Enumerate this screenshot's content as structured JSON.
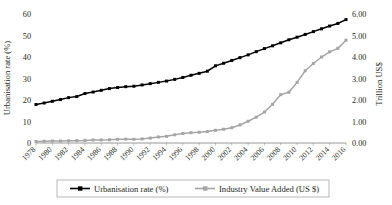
{
  "chart_data": {
    "type": "line",
    "title": "",
    "xlabel": "",
    "ylabel": "Urbanisation rate (%)",
    "y2label": "Trillion US$",
    "grid": false,
    "legend_position": "bottom",
    "x": [
      1978,
      1979,
      1980,
      1981,
      1982,
      1983,
      1984,
      1985,
      1986,
      1987,
      1988,
      1989,
      1990,
      1991,
      1992,
      1993,
      1994,
      1995,
      1996,
      1997,
      1998,
      1999,
      2000,
      2001,
      2002,
      2003,
      2004,
      2005,
      2006,
      2007,
      2008,
      2009,
      2010,
      2011,
      2012,
      2013,
      2014,
      2015,
      2016
    ],
    "xtick_labels": [
      "1978",
      "1980",
      "1982",
      "1984",
      "1986",
      "1988",
      "1990",
      "1992",
      "1994",
      "1996",
      "1998",
      "2000",
      "2002",
      "2004",
      "2006",
      "2008",
      "2010",
      "2012",
      "2014",
      "2016"
    ],
    "xtick_values": [
      1978,
      1980,
      1982,
      1984,
      1986,
      1988,
      1990,
      1992,
      1994,
      1996,
      1998,
      2000,
      2002,
      2004,
      2006,
      2008,
      2010,
      2012,
      2014,
      2016
    ],
    "ylim": [
      0,
      60
    ],
    "ytick_labels": [
      "0",
      "10",
      "20",
      "30",
      "40",
      "50",
      "60"
    ],
    "ytick_values": [
      0,
      10,
      20,
      30,
      40,
      50,
      60
    ],
    "y2lim": [
      0,
      6
    ],
    "y2tick_labels": [
      "0.00",
      "1.00",
      "2.00",
      "3.00",
      "4.00",
      "5.00",
      "6.00"
    ],
    "y2tick_values": [
      0,
      1,
      2,
      3,
      4,
      5,
      6
    ],
    "series": [
      {
        "name": "Urbanisation rate (%)",
        "axis": "left",
        "color": "#000000",
        "marker": "square",
        "values": [
          17.9,
          18.6,
          19.4,
          20.2,
          21.1,
          21.6,
          23.0,
          23.7,
          24.5,
          25.3,
          25.8,
          26.2,
          26.4,
          27.0,
          27.6,
          28.2,
          28.8,
          29.6,
          30.5,
          31.5,
          32.4,
          33.4,
          35.9,
          37.1,
          38.4,
          39.7,
          41.0,
          42.5,
          43.9,
          45.2,
          46.6,
          48.0,
          49.2,
          50.5,
          51.8,
          53.1,
          54.4,
          55.6,
          57.4
        ]
      },
      {
        "name": "Industry Value Added (US $)",
        "axis": "right",
        "color": "#a5a5a5",
        "marker": "square",
        "values": [
          0.07,
          0.08,
          0.09,
          0.09,
          0.1,
          0.11,
          0.12,
          0.14,
          0.14,
          0.15,
          0.17,
          0.18,
          0.17,
          0.19,
          0.23,
          0.28,
          0.31,
          0.38,
          0.44,
          0.48,
          0.5,
          0.53,
          0.59,
          0.64,
          0.71,
          0.84,
          1.01,
          1.2,
          1.44,
          1.8,
          2.25,
          2.36,
          2.82,
          3.36,
          3.7,
          4.0,
          4.24,
          4.4,
          4.78
        ]
      }
    ],
    "legend": [
      {
        "label": "Urbanisation rate (%)",
        "color": "#000000"
      },
      {
        "label": "Industry Value Added (US $)",
        "color": "#a5a5a5"
      }
    ]
  }
}
